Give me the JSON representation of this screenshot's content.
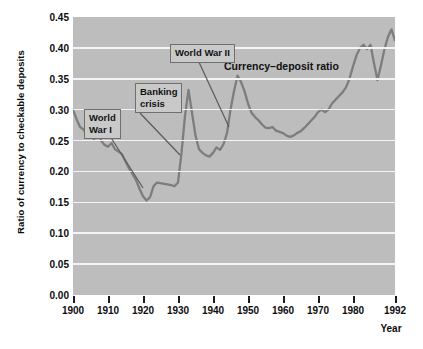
{
  "chart_data": {
    "type": "line",
    "title": "",
    "xlabel": "Year",
    "ylabel": "Ratio of currency to\ncheckable deposits",
    "xlim": [
      1900,
      1992
    ],
    "ylim": [
      0.0,
      0.45
    ],
    "grid": true,
    "legend_position": "inline-label",
    "series_label": "Currency–deposit ratio",
    "line_color": "#7d7d7d",
    "plot_background": "#bdbdbd",
    "gridline_color": "#f4f4f4",
    "yticks": [
      "0.00",
      "0.05",
      "0.10",
      "0.15",
      "0.20",
      "0.25",
      "0.30",
      "0.35",
      "0.40",
      "0.45"
    ],
    "ytick_values": [
      0.0,
      0.05,
      0.1,
      0.15,
      0.2,
      0.25,
      0.3,
      0.35,
      0.4,
      0.45
    ],
    "xticks": [
      "1900",
      "1910",
      "1920",
      "1930",
      "1940",
      "1950",
      "1960",
      "1970",
      "1980",
      "1992"
    ],
    "xtick_values": [
      1900,
      1910,
      1920,
      1930,
      1940,
      1950,
      1960,
      1970,
      1980,
      1992
    ],
    "series": [
      {
        "name": "Currency–deposit ratio",
        "x": [
          1900,
          1901,
          1902,
          1903,
          1904,
          1905,
          1906,
          1907,
          1908,
          1909,
          1910,
          1911,
          1912,
          1913,
          1914,
          1915,
          1916,
          1917,
          1918,
          1919,
          1920,
          1921,
          1922,
          1923,
          1924,
          1925,
          1926,
          1927,
          1928,
          1929,
          1930,
          1931,
          1932,
          1933,
          1934,
          1935,
          1936,
          1937,
          1938,
          1939,
          1940,
          1941,
          1942,
          1943,
          1944,
          1945,
          1946,
          1947,
          1948,
          1949,
          1950,
          1951,
          1952,
          1953,
          1954,
          1955,
          1956,
          1957,
          1958,
          1959,
          1960,
          1961,
          1962,
          1963,
          1964,
          1965,
          1966,
          1967,
          1968,
          1969,
          1970,
          1971,
          1972,
          1973,
          1974,
          1975,
          1976,
          1977,
          1978,
          1979,
          1980,
          1981,
          1982,
          1983,
          1984,
          1985,
          1986,
          1987,
          1988,
          1989,
          1990,
          1991,
          1992
        ],
        "y": [
          0.3,
          0.285,
          0.272,
          0.268,
          0.258,
          0.262,
          0.252,
          0.268,
          0.25,
          0.243,
          0.24,
          0.246,
          0.236,
          0.232,
          0.228,
          0.216,
          0.205,
          0.196,
          0.186,
          0.172,
          0.16,
          0.153,
          0.158,
          0.176,
          0.182,
          0.181,
          0.18,
          0.179,
          0.178,
          0.176,
          0.182,
          0.23,
          0.29,
          0.332,
          0.295,
          0.258,
          0.236,
          0.23,
          0.226,
          0.224,
          0.23,
          0.239,
          0.235,
          0.244,
          0.262,
          0.3,
          0.33,
          0.355,
          0.345,
          0.33,
          0.31,
          0.295,
          0.288,
          0.283,
          0.276,
          0.271,
          0.27,
          0.272,
          0.266,
          0.264,
          0.262,
          0.258,
          0.256,
          0.258,
          0.262,
          0.265,
          0.27,
          0.276,
          0.282,
          0.288,
          0.296,
          0.3,
          0.296,
          0.3,
          0.31,
          0.316,
          0.322,
          0.328,
          0.336,
          0.35,
          0.37,
          0.388,
          0.4,
          0.405,
          0.398,
          0.405,
          0.375,
          0.348,
          0.372,
          0.398,
          0.418,
          0.43,
          0.412
        ]
      }
    ],
    "annotations": [
      {
        "id": "world-war-i",
        "text": "World\nWar I",
        "box_left": 84,
        "box_top": 109,
        "leader": {
          "x1": 108,
          "y1": 133,
          "x2": 143,
          "y2": 188
        }
      },
      {
        "id": "banking-crisis",
        "text": "Banking\ncrisis",
        "box_left": 135,
        "box_top": 83,
        "leader": {
          "x1": 140,
          "y1": 113,
          "x2": 180,
          "y2": 155
        }
      },
      {
        "id": "world-war-ii",
        "text": "World War II",
        "box_left": 170,
        "box_top": 44,
        "leader": {
          "x1": 198,
          "y1": 60,
          "x2": 229,
          "y2": 127
        }
      }
    ]
  }
}
